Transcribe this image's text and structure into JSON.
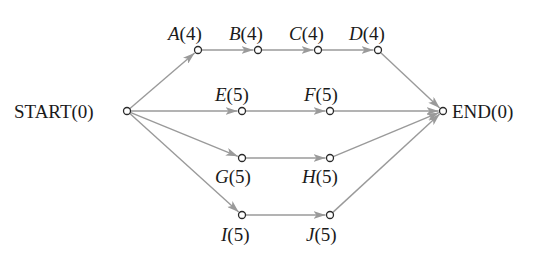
{
  "diagram": {
    "type": "activity-network",
    "colors": {
      "edge": "#9a9a9a",
      "node_stroke": "#2a2a2a",
      "text": "#1a1a1a"
    },
    "nodes": [
      {
        "id": "START",
        "name": "START",
        "weight": "(0)",
        "x": 127,
        "y": 111
      },
      {
        "id": "A",
        "name": "A",
        "weight": "(4)",
        "x": 198,
        "y": 50
      },
      {
        "id": "B",
        "name": "B",
        "weight": "(4)",
        "x": 258,
        "y": 50
      },
      {
        "id": "C",
        "name": "C",
        "weight": "(4)",
        "x": 318,
        "y": 50
      },
      {
        "id": "D",
        "name": "D",
        "weight": "(4)",
        "x": 378,
        "y": 50
      },
      {
        "id": "E",
        "name": "E",
        "weight": "(5)",
        "x": 242,
        "y": 111
      },
      {
        "id": "F",
        "name": "F",
        "weight": "(5)",
        "x": 330,
        "y": 111
      },
      {
        "id": "G",
        "name": "G",
        "weight": "(5)",
        "x": 242,
        "y": 158
      },
      {
        "id": "H",
        "name": "H",
        "weight": "(5)",
        "x": 330,
        "y": 158
      },
      {
        "id": "I",
        "name": "I",
        "weight": "(5)",
        "x": 242,
        "y": 215
      },
      {
        "id": "J",
        "name": "J",
        "weight": "(5)",
        "x": 330,
        "y": 215
      },
      {
        "id": "END",
        "name": "END",
        "weight": "(0)",
        "x": 443,
        "y": 111
      }
    ],
    "edges": [
      [
        "START",
        "A"
      ],
      [
        "A",
        "B"
      ],
      [
        "B",
        "C"
      ],
      [
        "C",
        "D"
      ],
      [
        "D",
        "END"
      ],
      [
        "START",
        "E"
      ],
      [
        "E",
        "F"
      ],
      [
        "F",
        "END"
      ],
      [
        "START",
        "G"
      ],
      [
        "G",
        "H"
      ],
      [
        "H",
        "END"
      ],
      [
        "START",
        "I"
      ],
      [
        "I",
        "J"
      ],
      [
        "J",
        "END"
      ]
    ],
    "labels": {
      "start": "START(0)",
      "end": "END(0)",
      "A": "A",
      "A_w": "(4)",
      "B": "B",
      "B_w": "(4)",
      "C": "C",
      "C_w": "(4)",
      "D": "D",
      "D_w": "(4)",
      "E": "E",
      "E_w": "(5)",
      "F": "F",
      "F_w": "(5)",
      "G": "G",
      "G_w": "(5)",
      "H": "H",
      "H_w": "(5)",
      "I": "I",
      "I_w": "(5)",
      "J": "J",
      "J_w": "(5)"
    }
  }
}
